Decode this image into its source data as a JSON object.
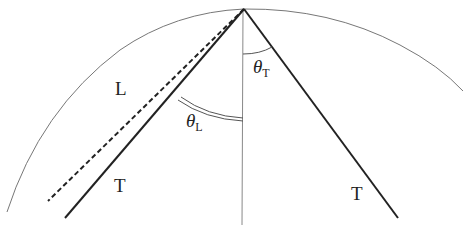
{
  "diagram": {
    "type": "wave-cone geometry",
    "labels": {
      "L": "L",
      "T_left": "T",
      "T_right": "T",
      "theta_T_symbol": "θ",
      "theta_T_sub": "T",
      "theta_L_symbol": "θ",
      "theta_L_sub": "L"
    },
    "elements": {
      "wavefront_arc": "large circular arc",
      "vertical_axis": "thin vertical line from apex",
      "dashed_line": "dashed line (L direction)",
      "left_T_line": "thick solid line",
      "right_T_line": "thick solid line",
      "theta_T_arc": "single arc between axis and right T line",
      "theta_L_arc": "double arc between left T line and axis"
    },
    "colors": {
      "stroke": "#222222",
      "thin_stroke": "#777777",
      "background": "#ffffff"
    }
  }
}
